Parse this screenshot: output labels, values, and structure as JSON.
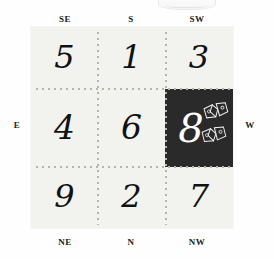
{
  "directions": {
    "top_left": "SE",
    "top_center": "S",
    "top_right": "SW",
    "left": "E",
    "right": "W",
    "bottom_left": "NE",
    "bottom_center": "N",
    "bottom_right": "NW"
  },
  "grid": {
    "rows": [
      [
        {
          "value": "5",
          "highlighted": false,
          "sector": "SE"
        },
        {
          "value": "1",
          "highlighted": false,
          "sector": "S"
        },
        {
          "value": "3",
          "highlighted": false,
          "sector": "SW"
        }
      ],
      [
        {
          "value": "4",
          "highlighted": false,
          "sector": "E"
        },
        {
          "value": "6",
          "highlighted": false,
          "sector": "center"
        },
        {
          "value": "8",
          "highlighted": true,
          "sector": "W"
        }
      ],
      [
        {
          "value": "9",
          "highlighted": false,
          "sector": "NE"
        },
        {
          "value": "2",
          "highlighted": false,
          "sector": "N"
        },
        {
          "value": "7",
          "highlighted": false,
          "sector": "NW"
        }
      ]
    ]
  },
  "highlight": {
    "value": "8",
    "background_color": "#2a2a2a",
    "text_color": "#ffffff",
    "ornament_count": 2,
    "ornament_name": "bow-ornament"
  },
  "colors": {
    "page_background": "#ffffff",
    "panel_background": "#f2f2ef",
    "grid_dot": "#b9b4a8",
    "number": "#111111",
    "label": "#1b1b1b"
  }
}
